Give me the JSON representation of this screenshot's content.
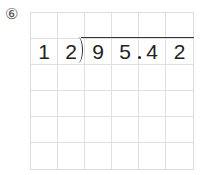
{
  "problem": {
    "number_label": "⑥",
    "divisor": [
      "1",
      "2"
    ],
    "dividend": [
      "9",
      "5",
      ".",
      "4",
      "2"
    ],
    "grid": {
      "columns": 6,
      "rows": 6,
      "row_values": [
        [
          "",
          "",
          "",
          "",
          "",
          ""
        ],
        [
          "1",
          "2",
          "9",
          "5",
          "4",
          "2"
        ],
        [
          "",
          "",
          "",
          "",
          "",
          ""
        ],
        [
          "",
          "",
          "",
          "",
          "",
          ""
        ],
        [
          "",
          "",
          "",
          "",
          "",
          ""
        ],
        [
          "",
          "",
          "",
          "",
          "",
          ""
        ]
      ]
    }
  }
}
